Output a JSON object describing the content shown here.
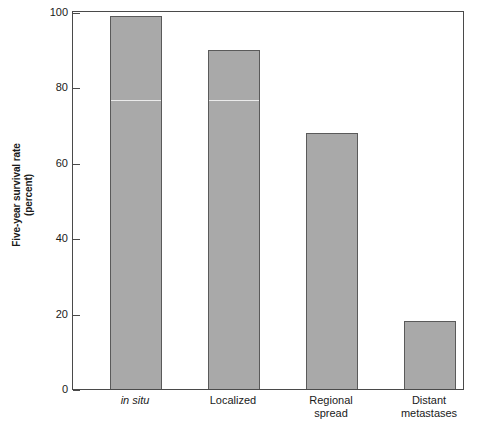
{
  "chart_data": {
    "type": "bar",
    "title": "",
    "subtitle": "",
    "xlabel": "",
    "ylabel_line1": "Five-year survival rate",
    "ylabel_line2": "(percent)",
    "categories": [
      "in situ",
      "Localized",
      "Regional spread",
      "Distant metastases"
    ],
    "category_lines": [
      [
        "in situ"
      ],
      [
        "Localized"
      ],
      [
        "Regional",
        "spread"
      ],
      [
        "Distant",
        "metastases"
      ]
    ],
    "category_styles": [
      "italic",
      "normal",
      "normal",
      "normal"
    ],
    "values": [
      99,
      90,
      68,
      18
    ],
    "ylim": [
      0,
      100
    ],
    "yticks": [
      0,
      20,
      40,
      60,
      80,
      100
    ],
    "ytick_labels": [
      "0",
      "20",
      "40",
      "60",
      "80",
      "100"
    ],
    "grid": false,
    "legend": "none",
    "bar_color": "#a9a9a9",
    "bar_edge_color": "#5a5a5a",
    "axis_color": "#4a4a4a",
    "background_color": "#ffffff"
  }
}
